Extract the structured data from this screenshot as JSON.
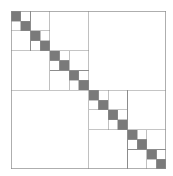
{
  "figure": {
    "name": "hierarchical-matrix-partition",
    "type": "block-partition-diagram",
    "title": "",
    "background_color": "#ffffff"
  },
  "canvas": {
    "image_width": 173,
    "image_height": 176,
    "plot_left": 11,
    "plot_top": 11,
    "plot_width": 155,
    "plot_height": 158
  },
  "style": {
    "line_color": "#8c8c8c",
    "border_color": "#8c8c8c",
    "dense_block_fill": "#7a7a7a",
    "admissible_block_fill": "#ffffff",
    "line_width": 0.7,
    "border_width": 0.8
  },
  "chart_data": {
    "type": "heatmap",
    "title": "Hierarchical matrix block partition",
    "xlabel": "",
    "ylabel": "",
    "structure": "recursive-quadtree",
    "max_depth": 4,
    "subdivision_rule": "diagonal-blocks-subdivide",
    "leaf_kinds": [
      "dense",
      "admissible"
    ],
    "dense_leaf_count": 32,
    "admissible_leaf_count": 30,
    "root_block": {
      "x": 0,
      "y": 0,
      "size": 1,
      "depth": 0,
      "kind": "split"
    },
    "legend": {
      "entries": [
        {
          "label": "dense (inadmissible) block",
          "color": "#7a7a7a"
        },
        {
          "label": "admissible (low-rank) block",
          "color": "#ffffff"
        }
      ],
      "position": "none",
      "visible": false
    },
    "axes": {
      "xlim": [
        0,
        1
      ],
      "ylim": [
        0,
        1
      ],
      "grid": false,
      "xticks": [],
      "yticks": [],
      "xticklabels": [],
      "yticklabels": [],
      "frame_visible": true
    },
    "annotations": []
  }
}
